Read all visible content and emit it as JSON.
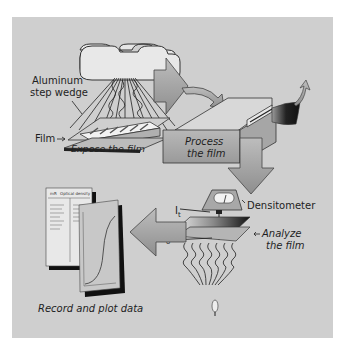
{
  "diagram": {
    "steps": [
      {
        "id": "expose",
        "label": "Expose the film"
      },
      {
        "id": "process",
        "label_line1": "Process",
        "label_line2": "the film"
      },
      {
        "id": "analyze",
        "label_line1": "Analyze",
        "label_line2": "the film"
      },
      {
        "id": "record",
        "label": "Record and plot data"
      }
    ],
    "labels": {
      "aluminum_line1": "Aluminum",
      "aluminum_line2": "step wedge",
      "film": "Film",
      "densitometer": "Densitometer",
      "i_t": "I",
      "i_t_sub": "t",
      "i_o": "I",
      "i_o_sub": "o",
      "table_header_left": "mR",
      "table_header_right": "Optical density"
    },
    "colors": {
      "panel": "#cfcfcf",
      "arrow_fill": "#a9a9a9",
      "outline": "#3a3a3a",
      "film_dark": "#1a1a1a",
      "paper": "#e6e6e6"
    }
  }
}
